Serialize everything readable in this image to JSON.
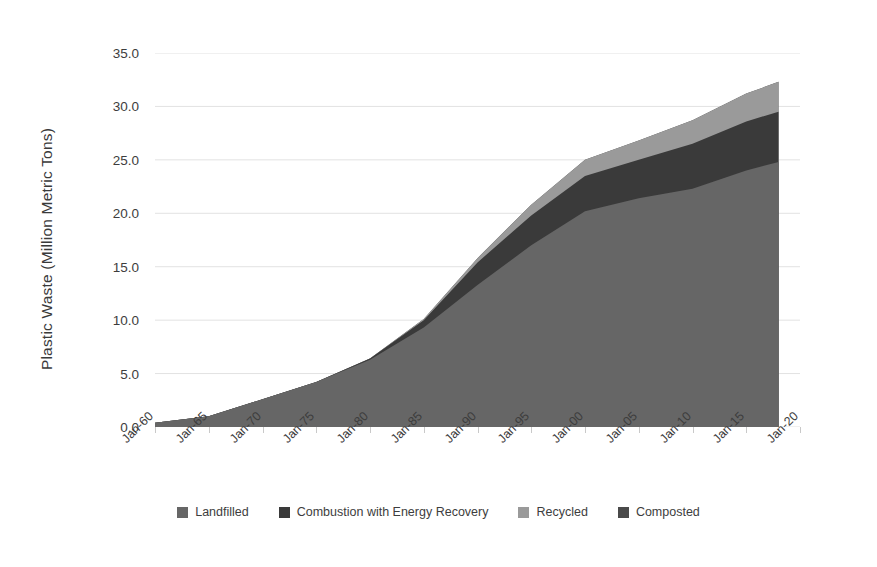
{
  "chart_data": {
    "type": "area",
    "stacked": true,
    "title": "",
    "xlabel": "",
    "ylabel": "Plastic Waste (Million Metric Tons)",
    "grid": true,
    "legend_position": "bottom",
    "ylim": [
      0.0,
      35.0
    ],
    "y_ticks": [
      "0.0",
      "5.0",
      "10.0",
      "15.0",
      "20.0",
      "25.0",
      "30.0",
      "35.0"
    ],
    "y_tick_values": [
      0.0,
      5.0,
      10.0,
      15.0,
      20.0,
      25.0,
      30.0,
      35.0
    ],
    "x_ticks": [
      "Jan-60",
      "Jan-65",
      "Jan-70",
      "Jan-75",
      "Jan-80",
      "Jan-85",
      "Jan-90",
      "Jan-95",
      "Jan-00",
      "Jan-05",
      "Jan-10",
      "Jan-15",
      "Jan-20"
    ],
    "x_tick_values": [
      1960,
      1965,
      1970,
      1975,
      1980,
      1985,
      1990,
      1995,
      2000,
      2005,
      2010,
      2015,
      2020
    ],
    "xlim": [
      1960,
      2020
    ],
    "x": [
      1960,
      1965,
      1970,
      1975,
      1980,
      1985,
      1990,
      1995,
      2000,
      2005,
      2010,
      2015,
      2018
    ],
    "series": [
      {
        "name": "Landfilled",
        "color": "#666666",
        "values": [
          0.39,
          1.0,
          2.6,
          4.2,
          6.3,
          9.3,
          13.3,
          17.0,
          20.2,
          21.4,
          22.3,
          24.0,
          24.8
        ]
      },
      {
        "name": "Combustion with Energy Recovery",
        "color": "#3a3a3a",
        "values": [
          0.0,
          0.0,
          0.0,
          0.0,
          0.1,
          0.7,
          2.1,
          2.8,
          3.3,
          3.6,
          4.2,
          4.6,
          4.7
        ]
      },
      {
        "name": "Recycled",
        "color": "#9a9a9a",
        "values": [
          0.0,
          0.0,
          0.0,
          0.0,
          0.0,
          0.1,
          0.4,
          1.0,
          1.5,
          1.8,
          2.2,
          2.6,
          2.8
        ]
      },
      {
        "name": "Composted",
        "color": "#4a4a4a",
        "values": [
          0.0,
          0.0,
          0.0,
          0.0,
          0.0,
          0.0,
          0.0,
          0.0,
          0.0,
          0.0,
          0.0,
          0.0,
          0.0
        ]
      }
    ],
    "totals": [
      0.39,
      1.0,
      2.6,
      4.2,
      6.4,
      10.1,
      15.8,
      20.8,
      25.0,
      26.8,
      28.7,
      31.2,
      32.3
    ],
    "gridline_color": "#e2e2e2",
    "background_color": "#ffffff"
  }
}
